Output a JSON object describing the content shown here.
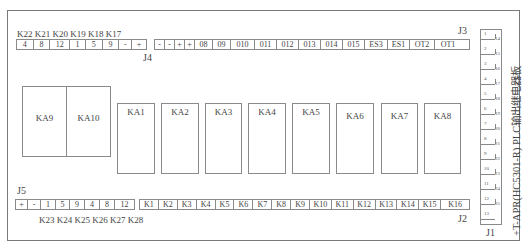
{
  "board": {
    "title": "+T-APR(HC5301-R) PLC输出继电器板"
  },
  "j4": {
    "name": "J4",
    "k_labels": "K22 K21 K20 K19 K18 K17",
    "left_block": [
      "4",
      "8",
      "12",
      "1",
      "5",
      "9",
      "-",
      "+"
    ],
    "right_block": [
      "-",
      "-",
      "+",
      "+",
      "08",
      "09",
      "010",
      "011",
      "012",
      "013",
      "014",
      "015",
      "ES3",
      "ES1",
      "OT2",
      "OT1"
    ]
  },
  "j3": {
    "name": "J3"
  },
  "j5": {
    "name": "J5",
    "cells": [
      "+",
      "-",
      "1",
      "5",
      "9",
      "4",
      "8",
      "12"
    ],
    "k_labels": "K23 K24 K25 K26 K27 K28"
  },
  "j2": {
    "name": "J2",
    "cells": [
      "K1",
      "K2",
      "K3",
      "K4",
      "K5",
      "K6",
      "K7",
      "K8",
      "K9",
      "K10",
      "K11",
      "K12",
      "K13",
      "K14",
      "K15",
      "K16"
    ]
  },
  "j1": {
    "name": "J1",
    "pins": [
      {
        "left": "1",
        "right": "14"
      },
      {
        "left": "2",
        "right": "15"
      },
      {
        "left": "3",
        "right": "16"
      },
      {
        "left": "4",
        "right": "17"
      },
      {
        "left": "5",
        "right": "18"
      },
      {
        "left": "6",
        "right": "19"
      },
      {
        "left": "7",
        "right": "20"
      },
      {
        "left": "8",
        "right": "21"
      },
      {
        "left": "9",
        "right": "22"
      },
      {
        "left": "10",
        "right": "23"
      },
      {
        "left": "11",
        "right": "24"
      },
      {
        "left": "12",
        "right": "25"
      },
      {
        "left": "13",
        "right": ""
      }
    ]
  },
  "relays": {
    "large": [
      "KA9",
      "KA10"
    ],
    "small": [
      "KA1",
      "KA2",
      "KA3",
      "KA4",
      "KA5",
      "KA6",
      "KA7",
      "KA8"
    ]
  }
}
